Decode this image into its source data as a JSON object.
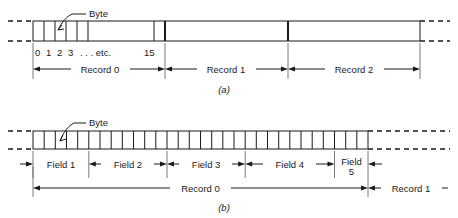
{
  "figure": {
    "background_color": "#ffffff",
    "line_color": "#1a1a1a"
  },
  "panel_a": {
    "caption": "(a)",
    "callout_label": "Byte",
    "byte_labels": [
      "0",
      "1",
      "2",
      "3",
      ". . . etc.",
      "15"
    ],
    "byte_cell_count": 16,
    "records": [
      {
        "label": "Record 0",
        "subdivided": true
      },
      {
        "label": "Record 1",
        "subdivided": false
      },
      {
        "label": "Record 2",
        "subdivided": false
      }
    ],
    "continues_left": true,
    "continues_right": true
  },
  "panel_b": {
    "caption": "(b)",
    "callout_label": "Byte",
    "byte_cell_count": 30,
    "fields": [
      {
        "label": "Field 1",
        "cells": 5
      },
      {
        "label": "Field 2",
        "cells": 7
      },
      {
        "label": "Field 3",
        "cells": 7
      },
      {
        "label": "Field 4",
        "cells": 8
      },
      {
        "label": "Field 5",
        "cells": 3
      }
    ],
    "field_5_label_line_1": "Field",
    "field_5_label_line_2": "5",
    "records": [
      {
        "label": "Record 0"
      },
      {
        "label": "Record 1"
      }
    ],
    "continues_left": true,
    "continues_right": true
  }
}
